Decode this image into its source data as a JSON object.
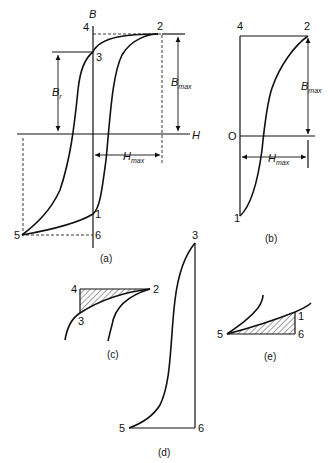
{
  "figure": {
    "panel_a": {
      "caption": "(a)",
      "axis_labels": {
        "y": "B",
        "x": "H"
      },
      "points": {
        "p1": "1",
        "p2": "2",
        "p3": "3",
        "p4": "4",
        "p5": "5",
        "p6": "6"
      },
      "dims": {
        "br": {
          "main": "B",
          "sub": "r"
        },
        "bmax": {
          "main": "B",
          "sub": "max"
        },
        "hmax": {
          "main": "H",
          "sub": "max"
        }
      }
    },
    "panel_b": {
      "caption": "(b)",
      "points": {
        "p0": "O",
        "p1": "1",
        "p2": "2",
        "p4": "4"
      },
      "dims": {
        "bmax": {
          "main": "B",
          "sub": "max"
        },
        "hmax": {
          "main": "H",
          "sub": "max"
        }
      }
    },
    "panel_c": {
      "caption": "(c)",
      "points": {
        "p2": "2",
        "p3": "3",
        "p4": "4"
      }
    },
    "panel_d": {
      "caption": "(d)",
      "points": {
        "p3": "3",
        "p5": "5",
        "p6": "6"
      }
    },
    "panel_e": {
      "caption": "(e)",
      "points": {
        "p1": "1",
        "p5": "5",
        "p6": "6"
      }
    }
  }
}
